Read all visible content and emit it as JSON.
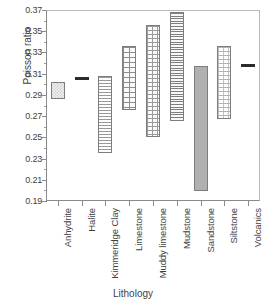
{
  "chart_data": {
    "type": "bar",
    "title": "",
    "xlabel": "Lithology",
    "ylabel": "Poisson ratio",
    "ylim": [
      0.19,
      0.37
    ],
    "ytick_labels": [
      "0.37",
      "0.35",
      "0.33",
      "0.31",
      "0.29",
      "0.27",
      "0.25",
      "0.23",
      "0.21",
      "0.19"
    ],
    "ytick_values": [
      0.37,
      0.35,
      0.33,
      0.31,
      0.29,
      0.27,
      0.25,
      0.23,
      0.21,
      0.19
    ],
    "grid": false,
    "legend": "none",
    "orientation": "vertical-range-bars",
    "categories": [
      "Anhydrite",
      "Halite",
      "Kimmeridge Clay",
      "Limestone",
      "Muddy limestone",
      "Mudstone",
      "Sandstone",
      "Siltstone",
      "Volcanics"
    ],
    "series": [
      {
        "name": "Poisson ratio range",
        "bars": [
          {
            "category": "Anhydrite",
            "low": 0.286,
            "high": 0.302,
            "fill": "checkerboard"
          },
          {
            "category": "Halite",
            "low": 0.305,
            "high": 0.307,
            "fill": "solid-dark"
          },
          {
            "category": "Kimmeridge Clay",
            "low": 0.235,
            "high": 0.308,
            "fill": "horizontal-lines"
          },
          {
            "category": "Limestone",
            "low": 0.276,
            "high": 0.336,
            "fill": "brick-grid"
          },
          {
            "category": "Muddy limestone",
            "low": 0.25,
            "high": 0.356,
            "fill": "fine-grid"
          },
          {
            "category": "Mudstone",
            "low": 0.265,
            "high": 0.368,
            "fill": "dense-horizontal-lines"
          },
          {
            "category": "Sandstone",
            "low": 0.199,
            "high": 0.317,
            "fill": "solid-gray"
          },
          {
            "category": "Siltstone",
            "low": 0.267,
            "high": 0.336,
            "fill": "dotted"
          },
          {
            "category": "Volcanics",
            "low": 0.317,
            "high": 0.319,
            "fill": "solid-dark"
          }
        ]
      }
    ]
  },
  "axis": {
    "y_title": "Poisson ratio",
    "x_title": "Lithology"
  },
  "colors": {
    "axis": "#8a8a8a",
    "text": "#3f3f3f",
    "bar_outline": "#7d7d7d",
    "solid_dark": "#2b2b2b",
    "solid_gray": "#b0b0b0"
  }
}
